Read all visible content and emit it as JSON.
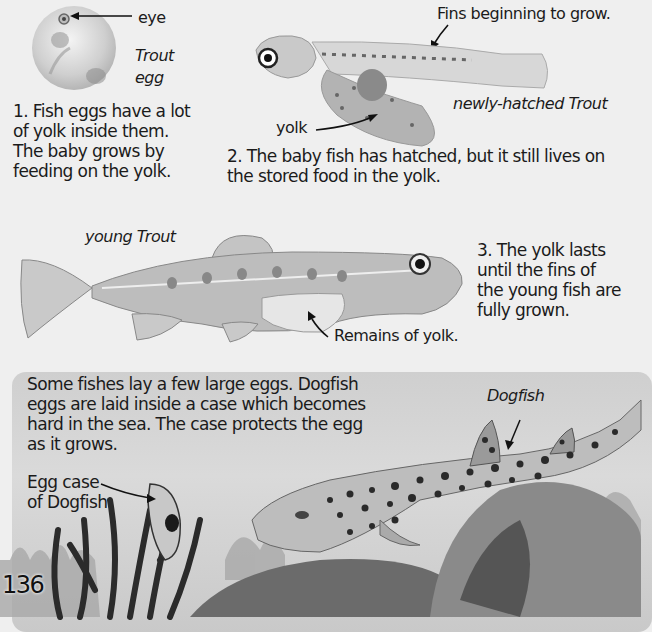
{
  "page_number": "136",
  "section1": {
    "egg_label_eye": "eye",
    "egg_title_line1": "Trout",
    "egg_title_line2": "egg",
    "caption_lines": [
      "1. Fish eggs have a lot",
      "of yolk inside them.",
      "The baby grows by",
      "feeding on the yolk."
    ]
  },
  "section2": {
    "fins_label": "Fins beginning to grow.",
    "yolk_label": "yolk",
    "fish_title": "newly-hatched Trout",
    "caption_lines": [
      "2. The baby fish has hatched, but it still lives on",
      "the stored food in the yolk."
    ]
  },
  "section3": {
    "fish_title": "young Trout",
    "remains_label": "Remains of yolk.",
    "caption_lines": [
      "3. The yolk lasts",
      "until the fins of",
      "the young fish are",
      "fully grown."
    ]
  },
  "panel": {
    "text_lines": [
      "Some fishes lay a few large eggs. Dogfish",
      "eggs are laid inside a case which becomes",
      "hard in the sea. The case protects the egg",
      "as it grows."
    ],
    "egg_case_label_lines": [
      "Egg case",
      "of Dogfish"
    ],
    "dogfish_label": "Dogfish"
  },
  "colors": {
    "background": "#efefef",
    "panel": "#d0d0d0",
    "text": "#1b1b1b"
  }
}
